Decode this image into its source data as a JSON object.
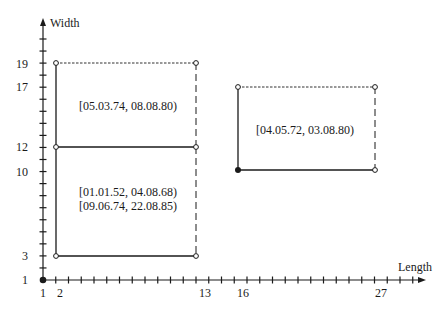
{
  "chart_data": {
    "type": "diagram",
    "title": "",
    "xlabel": "Length",
    "ylabel": "Width",
    "x_ticks_labeled": [
      1,
      2,
      13,
      16,
      27
    ],
    "y_ticks_labeled": [
      1,
      3,
      10,
      12,
      17,
      19
    ],
    "x_range": [
      1,
      30
    ],
    "y_range": [
      1,
      21
    ],
    "origin_point": {
      "x": 1,
      "y": 1,
      "style": "filled"
    },
    "rectangles": [
      {
        "name": "upper-left-region",
        "x": [
          2,
          13
        ],
        "y": [
          12,
          19
        ],
        "label_lines": [
          "[05.03.74, 08.08.80)"
        ],
        "edges": {
          "left": "solid",
          "bottom": "solid",
          "top": "dashed",
          "right": "dashed"
        }
      },
      {
        "name": "lower-left-region",
        "x": [
          2,
          13
        ],
        "y": [
          3,
          12
        ],
        "label_lines": [
          "[01.01.52, 04.08.68)",
          "[09.06.74, 22.08.85)"
        ],
        "edges": {
          "left": "solid",
          "bottom": "solid",
          "top": "solid",
          "right": "dashed"
        }
      },
      {
        "name": "right-region",
        "x": [
          16,
          27
        ],
        "y": [
          10,
          17
        ],
        "label_lines": [
          "[04.05.72, 03.08.80)"
        ],
        "corner_filled": {
          "x": 16,
          "y": 10
        },
        "edges": {
          "left": "solid",
          "bottom": "solid",
          "top": "dashed",
          "right": "dashed"
        }
      }
    ]
  },
  "axes": {
    "x_label": "Length",
    "y_label": "Width",
    "x_ticks": {
      "t1": "1",
      "t2": "2",
      "t13": "13",
      "t16": "16",
      "t27": "27"
    },
    "y_ticks": {
      "t1": "1",
      "t3": "3",
      "t10": "10",
      "t12": "12",
      "t17": "17",
      "t19": "19"
    }
  },
  "labels": {
    "upper_left": "[05.03.74, 08.08.80)",
    "lower_left_1": "[01.01.52, 04.08.68)",
    "lower_left_2": "[09.06.74, 22.08.85)",
    "right": "[04.05.72, 03.08.80)"
  }
}
